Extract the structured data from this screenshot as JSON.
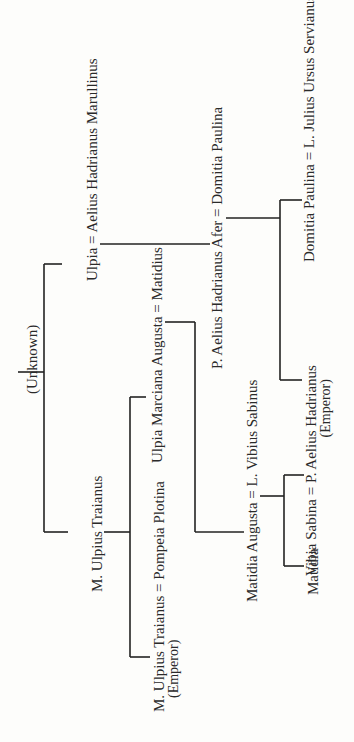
{
  "diagram": {
    "type": "family-tree",
    "orientation": "rotated-90-ccw",
    "nodes": {
      "unknown": "(Unknown)",
      "ulpia_couple": "Ulpia = Aelius Hadrianus Marullinus",
      "m_ulpius_traianus": "M. Ulpius Traianus",
      "trajan_couple": "M. Ulpius Traianus = Pompeia Plotina",
      "trajan_title": "(Emperor)",
      "marciana_couple": "Ulpia Marciana Augusta = Matidius",
      "afer_couple": "P. Aelius Hadrianus Afer = Domitia Paulina",
      "matidia_augusta_couple": "Matidia Augusta = L. Vibius Sabinus",
      "domitia_couple": "Domitia Paulina = L. Julius Ursus Servianus",
      "hadrian_couple": "Vibia Sabina = P. Aelius Hadrianus",
      "hadrian_title": "(Emperor)",
      "matidia": "Matidia"
    },
    "edges": [
      [
        "(Unknown)",
        "Ulpia"
      ],
      [
        "(Unknown)",
        "M. Ulpius Traianus"
      ],
      [
        "Ulpia = Aelius Hadrianus Marullinus",
        "P. Aelius Hadrianus Afer"
      ],
      [
        "M. Ulpius Traianus",
        "M. Ulpius Traianus (Emperor)"
      ],
      [
        "M. Ulpius Traianus",
        "Ulpia Marciana Augusta"
      ],
      [
        "Ulpia Marciana Augusta = Matidius",
        "Matidia Augusta"
      ],
      [
        "P. Aelius Hadrianus Afer = Domitia Paulina",
        "P. Aelius Hadrianus (Emperor)"
      ],
      [
        "P. Aelius Hadrianus Afer = Domitia Paulina",
        "Domitia Paulina"
      ],
      [
        "Matidia Augusta = L. Vibius Sabinus",
        "Vibia Sabina"
      ],
      [
        "Matidia Augusta = L. Vibius Sabinus",
        "Matidia"
      ]
    ]
  },
  "colors": {
    "background": "#fdfdfb",
    "ink": "#222222"
  }
}
